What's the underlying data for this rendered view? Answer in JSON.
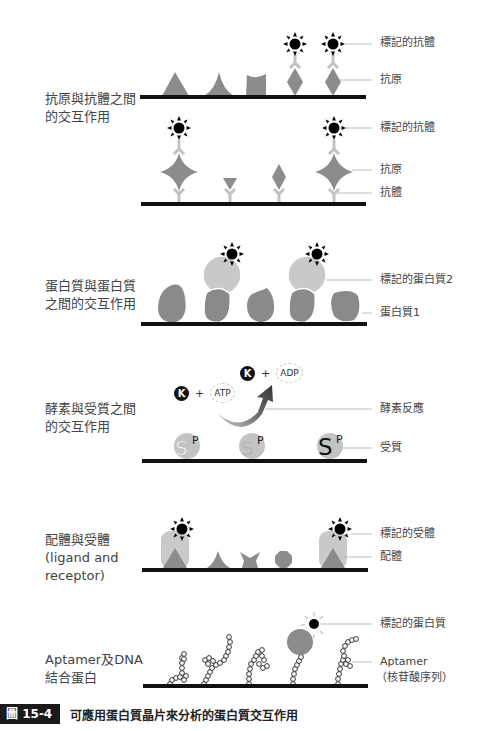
{
  "panels": [
    {
      "id": "antigen-antibody",
      "title": "抗原與抗體之間\n的交互作用",
      "labels": [
        "標記的抗體",
        "抗原",
        "標記的抗體",
        "抗原",
        "抗體"
      ]
    },
    {
      "id": "protein-protein",
      "title": "蛋白質與蛋白質\n之間的交互作用",
      "labels": [
        "標記的蛋白質2",
        "蛋白質1"
      ]
    },
    {
      "id": "enzyme-substrate",
      "title": "酵素與受質之間\n的交互作用",
      "labels": [
        "酵素反應",
        "受質"
      ],
      "reaction": {
        "kinase_symbol": "K",
        "plus": "+",
        "input": "ATP",
        "output": "ADP"
      },
      "substrate_symbol": "S",
      "phosphate_symbol": "P"
    },
    {
      "id": "ligand-receptor",
      "title": "配體與受體\n(ligand and\nreceptor)",
      "labels": [
        "標記的受體",
        "配體"
      ]
    },
    {
      "id": "aptamer-dna",
      "title": "Aptamer及DNA\n結合蛋白",
      "labels": [
        "標記的蛋白質",
        "Aptamer",
        "（核苷酸序列）"
      ]
    }
  ],
  "caption": {
    "figure_number": "圖 15-4",
    "text": "可應用蛋白質晶片來分析的蛋白質交互作用"
  },
  "colors": {
    "surface": "#111111",
    "antigen": "#8c8c8c",
    "antibody": "#c2c2c2",
    "protein_dark": "#8a8a8a",
    "protein_light": "#c9c9c9",
    "label_line": "#bdbdbd",
    "marker": "#000000"
  }
}
